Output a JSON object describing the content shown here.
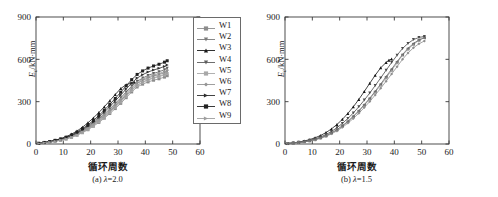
{
  "figure": {
    "panels": [
      {
        "id": "panel-a",
        "caption_prefix": "(a) ",
        "caption_lambda": "λ",
        "caption_value": "=2.0",
        "xlabel": "循环周数",
        "ylabel_main": "E",
        "ylabel_sub": "c",
        "ylabel_unit": "/kN·mm",
        "legend": [
          {
            "label": "W1",
            "color": "#8c8c8c",
            "marker": "square"
          },
          {
            "label": "W2",
            "color": "#7a7a7a",
            "marker": "triangle-down"
          },
          {
            "label": "W3",
            "color": "#1a1a1a",
            "marker": "triangle-up"
          },
          {
            "label": "W4",
            "color": "#5e5e5e",
            "marker": "triangle-down"
          },
          {
            "label": "W5",
            "color": "#a8a8a8",
            "marker": "square"
          },
          {
            "label": "W6",
            "color": "#949494",
            "marker": "diamond"
          },
          {
            "label": "W7",
            "color": "#2e2e2e",
            "marker": "triangle-right"
          },
          {
            "label": "W8",
            "color": "#222222",
            "marker": "square"
          },
          {
            "label": "W9",
            "color": "#9e9e9e",
            "marker": "triangle-right"
          }
        ]
      },
      {
        "id": "panel-b",
        "caption_prefix": "(b) ",
        "caption_lambda": "λ",
        "caption_value": "=1.5",
        "xlabel": "循环周数",
        "ylabel_main": "E",
        "ylabel_sub": "c",
        "ylabel_unit": "/kN·mm",
        "legend": [
          {
            "label": "W10",
            "color": "#9a9a9a",
            "marker": "square"
          },
          {
            "label": "W12",
            "color": "#161616",
            "marker": "triangle-up"
          },
          {
            "label": "W13",
            "color": "#4a4a4a",
            "marker": "triangle-down"
          },
          {
            "label": "W14",
            "color": "#8e8e8e",
            "marker": "diamond"
          },
          {
            "label": "W15",
            "color": "#6e6e6e",
            "marker": "triangle-left"
          }
        ]
      }
    ]
  },
  "chart_data": [
    {
      "type": "scatter",
      "panel": "(a) λ=2.0",
      "title": "",
      "xlabel": "循环周数",
      "ylabel": "Ec/kN·mm",
      "xlim": [
        0,
        60
      ],
      "ylim": [
        0,
        900
      ],
      "xticks": [
        0,
        10,
        20,
        30,
        40,
        50,
        60
      ],
      "yticks": [
        0,
        300,
        600,
        900
      ],
      "grid": false,
      "legend_position": "outside-right-top",
      "series": [
        {
          "name": "W1",
          "color": "#8c8c8c",
          "x": [
            1,
            3,
            5,
            7,
            9,
            11,
            13,
            15,
            17,
            19,
            21,
            23,
            25,
            27,
            29,
            31,
            33,
            35,
            37,
            39,
            41,
            43,
            45,
            47,
            48
          ],
          "y": [
            4,
            8,
            13,
            19,
            26,
            35,
            47,
            62,
            80,
            101,
            126,
            153,
            183,
            216,
            251,
            288,
            328,
            369,
            404,
            424,
            440,
            452,
            462,
            474,
            484
          ]
        },
        {
          "name": "W2",
          "color": "#7a7a7a",
          "x": [
            1,
            3,
            5,
            7,
            9,
            11,
            13,
            15,
            17,
            19,
            21,
            23,
            25,
            27,
            29,
            31,
            33,
            35,
            37,
            39,
            41,
            43,
            45,
            47,
            48
          ],
          "y": [
            4,
            9,
            14,
            21,
            29,
            39,
            52,
            68,
            88,
            111,
            138,
            167,
            199,
            233,
            270,
            309,
            350,
            392,
            428,
            450,
            468,
            481,
            492,
            505,
            515
          ]
        },
        {
          "name": "W3",
          "color": "#1a1a1a",
          "x": [
            1,
            3,
            5,
            7,
            9,
            11,
            13,
            15,
            17,
            19,
            21,
            23,
            25,
            27,
            29,
            31,
            33,
            35,
            36
          ],
          "y": [
            5,
            11,
            18,
            27,
            38,
            52,
            70,
            92,
            119,
            150,
            185,
            223,
            264,
            307,
            351,
            393,
            420,
            432,
            437
          ]
        },
        {
          "name": "W4",
          "color": "#5e5e5e",
          "x": [
            1,
            3,
            5,
            7,
            9,
            11,
            13,
            15,
            17,
            19,
            21,
            23,
            25,
            27,
            29,
            31,
            33,
            35,
            37,
            39,
            41,
            43,
            45,
            47,
            48
          ],
          "y": [
            4,
            9,
            15,
            22,
            31,
            42,
            56,
            73,
            94,
            119,
            147,
            178,
            212,
            248,
            287,
            327,
            369,
            410,
            444,
            467,
            486,
            500,
            512,
            526,
            537
          ]
        },
        {
          "name": "W5",
          "color": "#a8a8a8",
          "x": [
            1,
            3,
            5,
            7,
            9,
            11,
            13,
            15,
            17,
            19,
            21,
            23,
            25,
            27,
            29,
            31,
            33,
            35,
            37,
            39,
            41,
            43,
            45,
            47,
            48
          ],
          "y": [
            4,
            8,
            13,
            20,
            27,
            37,
            49,
            64,
            83,
            105,
            131,
            159,
            190,
            224,
            260,
            298,
            338,
            379,
            414,
            436,
            453,
            466,
            477,
            489,
            499
          ]
        },
        {
          "name": "W6",
          "color": "#949494",
          "x": [
            1,
            3,
            5,
            7,
            9,
            11,
            13,
            15,
            17,
            19,
            21,
            23,
            25,
            27,
            29,
            31,
            33,
            35,
            37,
            39,
            41,
            43,
            45,
            47,
            48
          ],
          "y": [
            4,
            9,
            14,
            21,
            30,
            40,
            54,
            70,
            91,
            115,
            142,
            172,
            205,
            241,
            279,
            318,
            359,
            400,
            435,
            458,
            476,
            489,
            500,
            513,
            523
          ]
        },
        {
          "name": "W7",
          "color": "#2e2e2e",
          "x": [
            1,
            3,
            5,
            7,
            9,
            11,
            13,
            15,
            17,
            19,
            21,
            23,
            25,
            27,
            29,
            31,
            33,
            35,
            37,
            39,
            41,
            43,
            45,
            47,
            48
          ],
          "y": [
            5,
            10,
            16,
            24,
            33,
            45,
            60,
            78,
            101,
            127,
            157,
            190,
            226,
            265,
            305,
            347,
            390,
            432,
            467,
            491,
            510,
            524,
            536,
            550,
            560
          ]
        },
        {
          "name": "W8",
          "color": "#222222",
          "x": [
            1,
            3,
            5,
            7,
            9,
            11,
            13,
            15,
            17,
            19,
            21,
            23,
            25,
            27,
            29,
            31,
            33,
            35,
            37,
            39,
            41,
            43,
            45,
            47,
            48
          ],
          "y": [
            5,
            11,
            17,
            26,
            36,
            48,
            64,
            84,
            108,
            135,
            167,
            202,
            240,
            281,
            323,
            367,
            412,
            456,
            493,
            518,
            538,
            553,
            565,
            580,
            590
          ]
        },
        {
          "name": "W9",
          "color": "#9e9e9e",
          "x": [
            1,
            3,
            5,
            7,
            9,
            11,
            13,
            15,
            17,
            19,
            21,
            23,
            25,
            27,
            29,
            31,
            33,
            35,
            37,
            39,
            41,
            43,
            45,
            47,
            48
          ],
          "y": [
            4,
            8,
            13,
            20,
            28,
            38,
            50,
            66,
            85,
            107,
            133,
            161,
            193,
            227,
            263,
            301,
            341,
            382,
            417,
            439,
            457,
            470,
            481,
            494,
            504
          ]
        }
      ]
    },
    {
      "type": "scatter",
      "panel": "(b) λ=1.5",
      "title": "",
      "xlabel": "循环周数",
      "ylabel": "Ec/kN·mm",
      "xlim": [
        0,
        60
      ],
      "ylim": [
        0,
        900
      ],
      "xticks": [
        0,
        10,
        20,
        30,
        40,
        50,
        60
      ],
      "yticks": [
        0,
        300,
        600,
        900
      ],
      "grid": false,
      "legend_position": "outside-right-top",
      "series": [
        {
          "name": "W10",
          "color": "#9a9a9a",
          "x": [
            1,
            3,
            5,
            7,
            9,
            11,
            13,
            15,
            17,
            19,
            21,
            23,
            25,
            27,
            29,
            31,
            33,
            35,
            37,
            39,
            41,
            43,
            45,
            47,
            49,
            51
          ],
          "y": [
            3,
            6,
            10,
            15,
            22,
            31,
            43,
            58,
            77,
            100,
            127,
            158,
            193,
            232,
            274,
            319,
            367,
            417,
            469,
            522,
            576,
            630,
            672,
            706,
            734,
            756
          ]
        },
        {
          "name": "W12",
          "color": "#161616",
          "x": [
            1,
            3,
            5,
            7,
            9,
            11,
            13,
            15,
            17,
            19,
            21,
            23,
            25,
            27,
            29,
            31,
            33,
            35,
            37,
            38,
            39
          ],
          "y": [
            4,
            8,
            14,
            21,
            31,
            44,
            60,
            81,
            107,
            138,
            175,
            217,
            264,
            316,
            372,
            430,
            487,
            540,
            578,
            594,
            602
          ]
        },
        {
          "name": "W13",
          "color": "#4a4a4a",
          "x": [
            1,
            3,
            5,
            7,
            9,
            11,
            13,
            15,
            17,
            19,
            21,
            23,
            25,
            27,
            29,
            31,
            33,
            35,
            37,
            39,
            41,
            43,
            45,
            47,
            49,
            51
          ],
          "y": [
            4,
            7,
            12,
            18,
            26,
            36,
            50,
            67,
            89,
            115,
            146,
            181,
            220,
            264,
            311,
            361,
            414,
            468,
            523,
            577,
            629,
            677,
            713,
            740,
            755,
            762
          ]
        },
        {
          "name": "W14",
          "color": "#8e8e8e",
          "x": [
            1,
            3,
            5,
            7,
            9,
            11,
            13,
            15,
            17,
            19,
            21,
            23,
            25,
            27,
            29,
            31,
            33,
            35,
            37,
            39,
            41,
            43,
            45,
            47,
            49,
            51
          ],
          "y": [
            3,
            6,
            10,
            15,
            21,
            29,
            40,
            54,
            72,
            93,
            118,
            148,
            181,
            218,
            258,
            301,
            347,
            395,
            445,
            496,
            548,
            600,
            645,
            682,
            710,
            730
          ]
        },
        {
          "name": "W15",
          "color": "#6e6e6e",
          "x": [
            1,
            3,
            5,
            7,
            9,
            11,
            13,
            15,
            17,
            19,
            21,
            23,
            25,
            27,
            29,
            31,
            33,
            35,
            37,
            39,
            41,
            43,
            45,
            47,
            49,
            51
          ],
          "y": [
            3,
            7,
            11,
            16,
            23,
            32,
            44,
            59,
            79,
            102,
            130,
            161,
            197,
            236,
            279,
            325,
            374,
            425,
            478,
            531,
            584,
            634,
            678,
            712,
            738,
            752
          ]
        }
      ]
    }
  ]
}
